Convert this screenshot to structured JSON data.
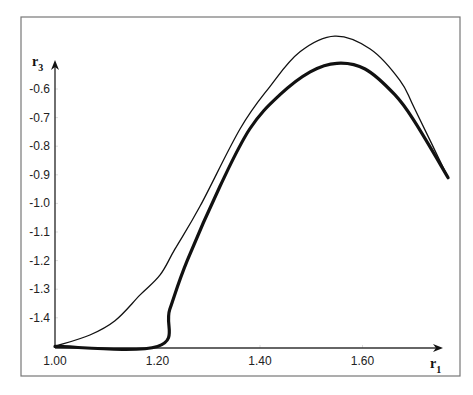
{
  "chart_data": {
    "type": "line",
    "title": "",
    "xlabel": "r",
    "xlabel_sub": "1",
    "ylabel": "r",
    "ylabel_sub": "3",
    "xlim": [
      1.0,
      1.78
    ],
    "ylim": [
      -1.5,
      -0.5
    ],
    "grid": false,
    "legend": null,
    "x_ticks": [
      {
        "value": 1.0,
        "label": "1.00"
      },
      {
        "value": 1.2,
        "label": "1.20"
      },
      {
        "value": 1.4,
        "label": "1.40"
      },
      {
        "value": 1.6,
        "label": "1.60"
      }
    ],
    "y_ticks": [
      {
        "value": -0.6,
        "label": "-0.6"
      },
      {
        "value": -0.7,
        "label": "-0.7"
      },
      {
        "value": -0.8,
        "label": "-0.8"
      },
      {
        "value": -0.9,
        "label": "-0.9"
      },
      {
        "value": -1.0,
        "label": "-1.0"
      },
      {
        "value": -1.1,
        "label": "-1.1"
      },
      {
        "value": -1.2,
        "label": "-1.2"
      },
      {
        "value": -1.3,
        "label": "-1.3"
      },
      {
        "value": -1.4,
        "label": "-1.4"
      }
    ],
    "series": [
      {
        "name": "thin curve",
        "stroke_width": 1.3,
        "color": "#111111",
        "x": [
          1.0,
          1.068,
          1.117,
          1.166,
          1.205,
          1.234,
          1.283,
          1.361,
          1.42,
          1.478,
          1.546,
          1.615,
          1.673,
          1.702,
          1.767
        ],
        "y": [
          -1.5,
          -1.46,
          -1.41,
          -1.32,
          -1.25,
          -1.16,
          -1.01,
          -0.74,
          -0.59,
          -0.47,
          -0.415,
          -0.46,
          -0.57,
          -0.67,
          -0.91
        ]
      },
      {
        "name": "thick curve",
        "stroke_width": 3.2,
        "color": "#111111",
        "x": [
          1.0,
          1.2,
          1.224,
          1.258,
          1.322,
          1.38,
          1.439,
          1.498,
          1.55,
          1.605,
          1.663,
          1.702,
          1.767
        ],
        "y": [
          -1.5,
          -1.5,
          -1.37,
          -1.2,
          -0.94,
          -0.74,
          -0.62,
          -0.54,
          -0.51,
          -0.53,
          -0.62,
          -0.715,
          -0.91
        ]
      }
    ]
  },
  "layout": {
    "frame": {
      "x": 21,
      "y": 17,
      "w": 439,
      "h": 359
    },
    "origin_px": {
      "x": 55,
      "y": 348
    },
    "x_scale": {
      "r1_at_px55": 1.0,
      "px_per_unit": 512.5
    },
    "y_scale": {
      "r3_ref": -0.6,
      "px_at_ref": 89,
      "px_per_unit": 286
    },
    "x_axis_end": 443,
    "y_axis_top": 60
  }
}
